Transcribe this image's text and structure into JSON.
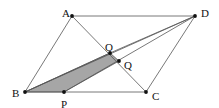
{
  "figure": {
    "type": "geometry-diagram",
    "width": 219,
    "height": 108,
    "background_color": "#ffffff",
    "line_color": "#555555",
    "shade_fill_color": "#a6a6a6",
    "point_color": "#111111",
    "label_color": "#111111"
  },
  "points": {
    "A": {
      "label": "A",
      "x": 72,
      "y": 16,
      "label_x": 62,
      "label_y": 14
    },
    "D": {
      "label": "D",
      "x": 195,
      "y": 16,
      "label_x": 201,
      "label_y": 14
    },
    "B": {
      "label": "B",
      "x": 25,
      "y": 92,
      "label_x": 12,
      "label_y": 94
    },
    "C": {
      "label": "C",
      "x": 146,
      "y": 92,
      "label_x": 152,
      "label_y": 97
    },
    "P": {
      "label": "P",
      "x": 64,
      "y": 92,
      "label_x": 61,
      "label_y": 105
    },
    "O": {
      "label": "O",
      "x": 110,
      "y": 53,
      "label_x": 105,
      "label_y": 48
    },
    "Q": {
      "label": "Q",
      "x": 119,
      "y": 61,
      "label_x": 124,
      "label_y": 66
    }
  },
  "segments": [
    {
      "name": "side-AD",
      "from": "A",
      "to": "D"
    },
    {
      "name": "side-BC",
      "from": "B",
      "to": "C"
    },
    {
      "name": "side-AB",
      "from": "A",
      "to": "B"
    },
    {
      "name": "side-DC",
      "from": "D",
      "to": "C"
    },
    {
      "name": "diagonal-AC",
      "from": "A",
      "to": "C"
    },
    {
      "name": "diagonal-BD",
      "from": "B",
      "to": "D"
    },
    {
      "name": "cevian-PD",
      "from": "P",
      "to": "D"
    },
    {
      "name": "cevian-OD",
      "from": "O",
      "to": "D"
    },
    {
      "name": "cevian-BO",
      "from": "B",
      "to": "O"
    }
  ],
  "shaded_region": {
    "name": "quadrilateral-BPQO",
    "vertices": [
      "B",
      "P",
      "Q",
      "O"
    ],
    "fill": "#a6a6a6"
  },
  "labels": [
    "A",
    "D",
    "B",
    "C",
    "P",
    "O",
    "Q"
  ]
}
